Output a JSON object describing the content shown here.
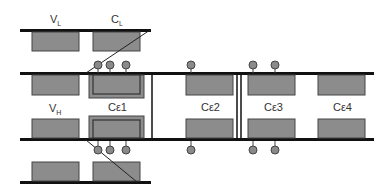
{
  "labels": {
    "vl": {
      "main": "V",
      "sub": "L"
    },
    "cl": {
      "main": "C",
      "sub": "L"
    },
    "vh": {
      "main": "V",
      "sub": "H"
    },
    "ce1": "Cε1",
    "ce2": "Cε2",
    "ce3": "Cε3",
    "ce4": "Cε4"
  },
  "colors": {
    "line": "#111111",
    "box_fill": "#8c8c8c",
    "box_stroke": "#444444",
    "ball_fill": "#8a8a8a",
    "ball_stroke": "#444444",
    "background": "#ffffff"
  }
}
